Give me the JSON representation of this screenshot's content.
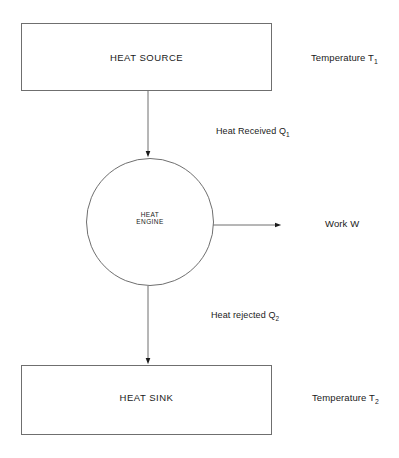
{
  "diagram": {
    "stroke_color": "#6f6f6f",
    "text_color": "#1a1a1a",
    "background_color": "#ffffff",
    "nodes": {
      "heat_source": {
        "label": "HEAT SOURCE",
        "side_label_prefix": "Temperature T",
        "side_label_sub": "1",
        "shape": "rectangle"
      },
      "heat_engine": {
        "label_line1": "HEAT",
        "label_line2": "ENGINE",
        "shape": "circle"
      },
      "heat_sink": {
        "label": "HEAT SINK",
        "side_label_prefix": "Temperature T",
        "side_label_sub": "2",
        "shape": "rectangle"
      }
    },
    "flows": {
      "heat_in": {
        "label_prefix": "Heat Received Q",
        "label_sub": "1",
        "direction": "down",
        "from": "heat_source",
        "to": "heat_engine"
      },
      "work_out": {
        "label_prefix": "Work W",
        "label_sub": "",
        "direction": "right",
        "from": "heat_engine",
        "to": "surroundings"
      },
      "heat_out": {
        "label_prefix": "Heat rejected Q",
        "label_sub": "2",
        "direction": "down",
        "from": "heat_engine",
        "to": "heat_sink"
      }
    }
  }
}
